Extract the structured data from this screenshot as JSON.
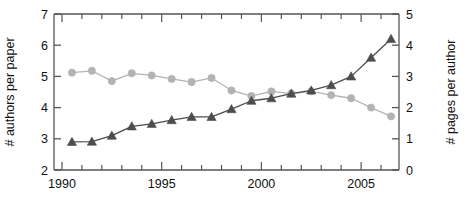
{
  "chart_data": {
    "type": "line",
    "title": "",
    "xlabel": "",
    "ylabel": "# authors per paper",
    "y2label": "# pages per author",
    "grid": false,
    "legend": "none",
    "xlim": [
      1989.6,
      1906.9
    ],
    "x_axis": {
      "min": 1989.6,
      "max": 1906.9,
      "major_ticks": [
        1990,
        1995,
        2000,
        2005
      ],
      "major_tick_labels": [
        "1990",
        "1995",
        "2000",
        "2005"
      ],
      "minor_ticks": [
        1990,
        1991,
        1992,
        1993,
        1994,
        1995,
        1996,
        1997,
        1998,
        1999,
        2000,
        2001,
        2002,
        2003,
        2004,
        2005,
        2006
      ]
    },
    "y_axis_left": {
      "label": "# authors per paper",
      "min": 2,
      "max": 7,
      "ticks": [
        2,
        3,
        4,
        5,
        6,
        7
      ],
      "tick_labels": [
        "2",
        "3",
        "4",
        "5",
        "6",
        "7"
      ]
    },
    "y_axis_right": {
      "label": "# pages per author",
      "min": 0,
      "max": 5,
      "ticks": [
        0,
        1,
        2,
        3,
        4,
        5
      ],
      "tick_labels": [
        "0",
        "1",
        "2",
        "3",
        "4",
        "5"
      ]
    },
    "x": [
      1990.5,
      1991.5,
      1992.5,
      1993.5,
      1994.5,
      1995.5,
      1996.5,
      1997.5,
      1998.5,
      1999.5,
      2000.5,
      2001.5,
      2002.5,
      2003.5,
      2004.5,
      2005.5,
      2006.5
    ],
    "series": [
      {
        "name": "# authors per paper",
        "axis": "left",
        "marker": "circle",
        "color": "#b3b3b3",
        "values": [
          5.12,
          5.18,
          4.85,
          5.1,
          5.03,
          4.92,
          4.82,
          4.95,
          4.55,
          4.37,
          4.52,
          4.45,
          4.52,
          4.4,
          4.3,
          4.0,
          3.72
        ]
      },
      {
        "name": "# pages per author",
        "axis": "right",
        "marker": "triangle",
        "color": "#4d4d4d",
        "values": [
          0.9,
          0.91,
          1.1,
          1.4,
          1.48,
          1.6,
          1.7,
          1.7,
          1.95,
          2.22,
          2.3,
          2.45,
          2.55,
          2.72,
          3.0,
          3.6,
          4.2
        ]
      }
    ]
  }
}
